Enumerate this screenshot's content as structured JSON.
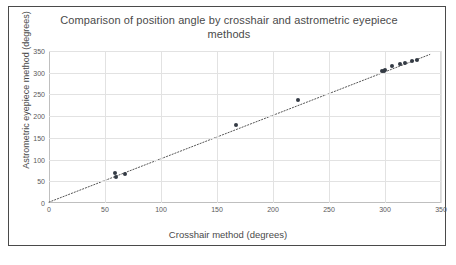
{
  "chart_data": {
    "type": "scatter",
    "title": "Comparison of position angle by crosshair and astrometric eyepiece methods",
    "xlabel": "Crosshair method (degrees)",
    "ylabel": "Astrometric eyepiece method (degrees)",
    "xlim": [
      0,
      350
    ],
    "ylim": [
      0,
      350
    ],
    "xticks": [
      0,
      50,
      100,
      150,
      200,
      250,
      300,
      350
    ],
    "yticks": [
      0,
      50,
      100,
      150,
      200,
      250,
      300,
      350
    ],
    "grid": true,
    "legend": "none",
    "series": [
      {
        "name": "Position angle measurements",
        "marker": "filled-circle",
        "color": "#333a44",
        "points": [
          {
            "x": 59,
            "y": 68
          },
          {
            "x": 60,
            "y": 60
          },
          {
            "x": 68,
            "y": 67
          },
          {
            "x": 167,
            "y": 180
          },
          {
            "x": 222,
            "y": 238
          },
          {
            "x": 297,
            "y": 303
          },
          {
            "x": 299,
            "y": 305
          },
          {
            "x": 300,
            "y": 306
          },
          {
            "x": 306,
            "y": 316
          },
          {
            "x": 313,
            "y": 319
          },
          {
            "x": 318,
            "y": 323
          },
          {
            "x": 324,
            "y": 327
          },
          {
            "x": 329,
            "y": 330
          }
        ]
      }
    ],
    "trendline": {
      "type": "linear",
      "style": "dotted",
      "color": "#555555",
      "x_start": 0,
      "y_start": 2,
      "x_end": 340,
      "y_end": 342
    }
  },
  "caption": {
    "text": ""
  }
}
